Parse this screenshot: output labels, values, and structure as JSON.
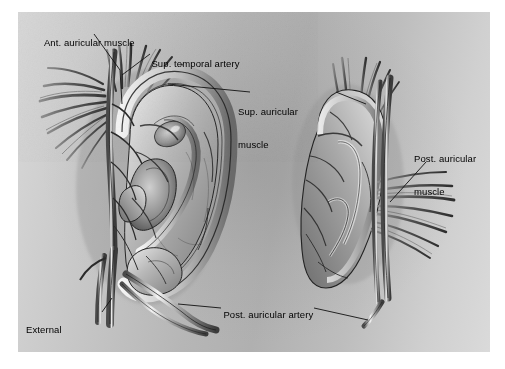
{
  "figure": {
    "type": "anatomical-illustration",
    "views": [
      {
        "name": "lateral-ear-view",
        "description": "Anterior (lateral) view of the auricle showing helix, antihelix, concha, tragus and superficial temporal artery branches"
      },
      {
        "name": "posterior-ear-view",
        "description": "Posterior (medial) view of the auricle showing posterior auricular muscle and posterior auricular artery"
      }
    ]
  },
  "background": {
    "panel_color": "#b8b8b8",
    "page_color": "#ffffff"
  },
  "labels": [
    {
      "id": "ant-auricular-muscle",
      "text": "Ant. auricular muscle",
      "lines": [
        "Ant. auricular muscle"
      ],
      "x": 28,
      "y": 26
    },
    {
      "id": "sup-temporal-artery",
      "text": "Sup. temporal artery",
      "lines": [
        "Sup. temporal artery"
      ],
      "x": 135,
      "y": 47
    },
    {
      "id": "sup-auricular-muscle",
      "text": "Sup. auricular muscle",
      "lines": [
        "Sup. auricular",
        "muscle"
      ],
      "x": 238,
      "y": 84
    },
    {
      "id": "post-auricular-muscle",
      "text": "Post. auricular muscle",
      "lines": [
        "Post. auricular",
        "muscle"
      ],
      "x": 414,
      "y": 131
    },
    {
      "id": "external-carotid-artery",
      "text": "External carotid artery",
      "lines": [
        "External",
        "carotid artery"
      ],
      "x": 26,
      "y": 302
    },
    {
      "id": "post-auricular-artery",
      "text": "Post. auricular artery",
      "lines": [
        "Post. auricular artery"
      ],
      "x": 207,
      "y": 298
    }
  ],
  "structures": [
    {
      "id": "helix",
      "view": "lateral-ear-view"
    },
    {
      "id": "antihelix",
      "view": "lateral-ear-view"
    },
    {
      "id": "concha",
      "view": "lateral-ear-view"
    },
    {
      "id": "tragus",
      "view": "lateral-ear-view"
    },
    {
      "id": "lobule",
      "view": "lateral-ear-view"
    },
    {
      "id": "anterior-auricular-muscle-fibers",
      "view": "lateral-ear-view"
    },
    {
      "id": "superior-auricular-muscle-fibers",
      "view": "lateral-ear-view"
    },
    {
      "id": "superficial-temporal-artery",
      "view": "lateral-ear-view"
    },
    {
      "id": "external-carotid-artery-trunk",
      "view": "lateral-ear-view"
    },
    {
      "id": "posterior-auricular-artery-branch",
      "view": "lateral-ear-view"
    },
    {
      "id": "posterior-auricular-muscle-fibers",
      "view": "posterior-ear-view"
    },
    {
      "id": "cranial-surface-of-auricle",
      "view": "posterior-ear-view"
    },
    {
      "id": "posterior-auricular-artery-posterior",
      "view": "posterior-ear-view"
    }
  ]
}
